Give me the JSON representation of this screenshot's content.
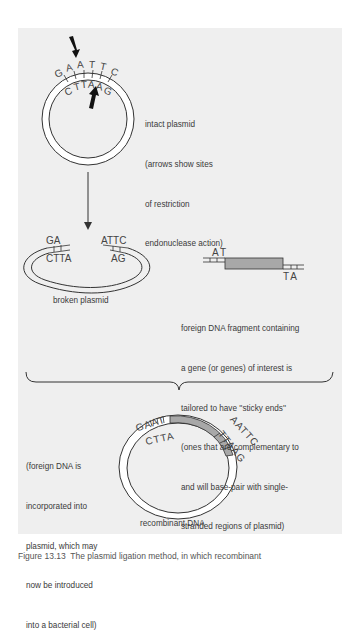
{
  "figure": {
    "intact_plasmid": {
      "label_lines": [
        "intact plasmid",
        "(arrows show sites",
        "of restriction",
        "endonuclease action)"
      ],
      "top_strand": [
        "G",
        "A",
        "A",
        "T",
        "T",
        "C"
      ],
      "bottom_strand": [
        "C",
        "T",
        "T",
        "A",
        "A",
        "G"
      ]
    },
    "broken_plasmid": {
      "label": "broken plasmid",
      "left_top": "GA",
      "left_bottom": "CTTA",
      "right_top": "ATTC",
      "right_bottom": "AG"
    },
    "foreign_fragment": {
      "left_end": "AT",
      "right_end": "TA",
      "label_lines": [
        "foreign DNA fragment containing",
        "a gene (or genes) of interest is",
        "tailored to have ''sticky ends''",
        "(ones that are complementary to",
        "and will base-pair with single-",
        "stranded regions of plasmid)"
      ]
    },
    "recombinant": {
      "label": "recombinant DNA",
      "left_top": "GAAT",
      "left_bottom": "CTTA",
      "right_top": "AATTC",
      "right_bottom": "TTAAG",
      "note_lines": [
        "(foreign DNA is",
        "incorporated into",
        "plasmid, which may",
        "now be introduced",
        "into a bacterial cell)"
      ]
    },
    "colors": {
      "panel_bg": "#efefef",
      "fragment_fill": "#a8a8a8",
      "line": "#333333"
    },
    "caption": "Figure 13.13  The plasmid ligation method, in which recombinant"
  }
}
